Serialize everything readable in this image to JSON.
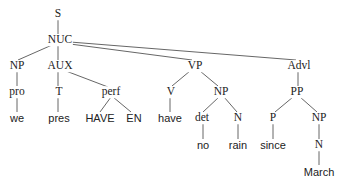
{
  "diagram": {
    "type": "syntax-tree",
    "nodes": {
      "S": "S",
      "NUC": "NUC",
      "NP1": "NP",
      "AUX": "AUX",
      "VP": "VP",
      "Advl": "Advl",
      "pro": "pro",
      "T": "T",
      "perf": "perf",
      "V": "V",
      "NP2": "NP",
      "PP": "PP",
      "we": "we",
      "pres": "pres",
      "HAVE": "HAVE",
      "EN": "EN",
      "have": "have",
      "det": "det",
      "N1": "N",
      "P": "P",
      "NP3": "NP",
      "no": "no",
      "rain": "rain",
      "since": "since",
      "N2": "N",
      "March": "March"
    },
    "edges": [
      [
        "S",
        "NUC"
      ],
      [
        "NUC",
        "NP1"
      ],
      [
        "NUC",
        "AUX"
      ],
      [
        "NUC",
        "VP"
      ],
      [
        "NUC",
        "Advl"
      ],
      [
        "NP1",
        "pro"
      ],
      [
        "pro",
        "we"
      ],
      [
        "AUX",
        "T"
      ],
      [
        "AUX",
        "perf"
      ],
      [
        "T",
        "pres"
      ],
      [
        "perf",
        "HAVE"
      ],
      [
        "perf",
        "EN"
      ],
      [
        "VP",
        "V"
      ],
      [
        "VP",
        "NP2"
      ],
      [
        "V",
        "have"
      ],
      [
        "NP2",
        "det"
      ],
      [
        "NP2",
        "N1"
      ],
      [
        "det",
        "no"
      ],
      [
        "N1",
        "rain"
      ],
      [
        "Advl",
        "PP"
      ],
      [
        "PP",
        "P"
      ],
      [
        "PP",
        "NP3"
      ],
      [
        "P",
        "since"
      ],
      [
        "NP3",
        "N2"
      ],
      [
        "N2",
        "March"
      ]
    ]
  }
}
